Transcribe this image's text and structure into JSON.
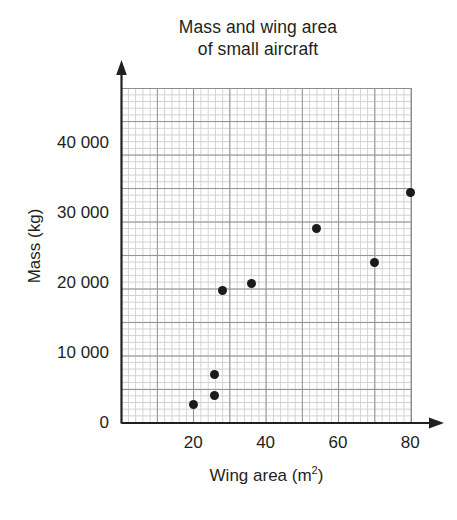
{
  "chart_data": {
    "type": "scatter",
    "title": "Mass and wing area of small aircraft",
    "title_lines": [
      "Mass and wing area",
      "of small aircraft"
    ],
    "xlabel": "Wing area (m2)",
    "xlabel_text": "Wing area (m",
    "xlabel_sup": "2",
    "xlabel_tail": ")",
    "ylabel": "Mass (kg)",
    "xlim": [
      0,
      80.5
    ],
    "ylim": [
      0,
      47900
    ],
    "xticks": [
      20,
      40,
      60,
      80
    ],
    "xtick_labels": [
      "20",
      "40",
      "60",
      "80"
    ],
    "yticks": [
      0,
      10000,
      20000,
      30000,
      40000
    ],
    "ytick_labels": [
      "0",
      "10 000",
      "20 000",
      "30 000",
      "40 000"
    ],
    "grid": "minor and major grid, major every 5 minor squares",
    "legend": "none",
    "marker": "filled black circle",
    "points": [
      {
        "x": 20,
        "y": 2700
      },
      {
        "x": 26,
        "y": 4000
      },
      {
        "x": 26,
        "y": 7000
      },
      {
        "x": 28,
        "y": 19000
      },
      {
        "x": 36,
        "y": 20000
      },
      {
        "x": 54,
        "y": 27800
      },
      {
        "x": 70,
        "y": 23000
      },
      {
        "x": 80,
        "y": 33000
      }
    ]
  },
  "colors": {
    "marker": "#1a1a1a",
    "axis": "#231f20",
    "grid_minor": "#c9c9c9",
    "grid_major": "#8e8e8e",
    "background": "#ffffff"
  }
}
